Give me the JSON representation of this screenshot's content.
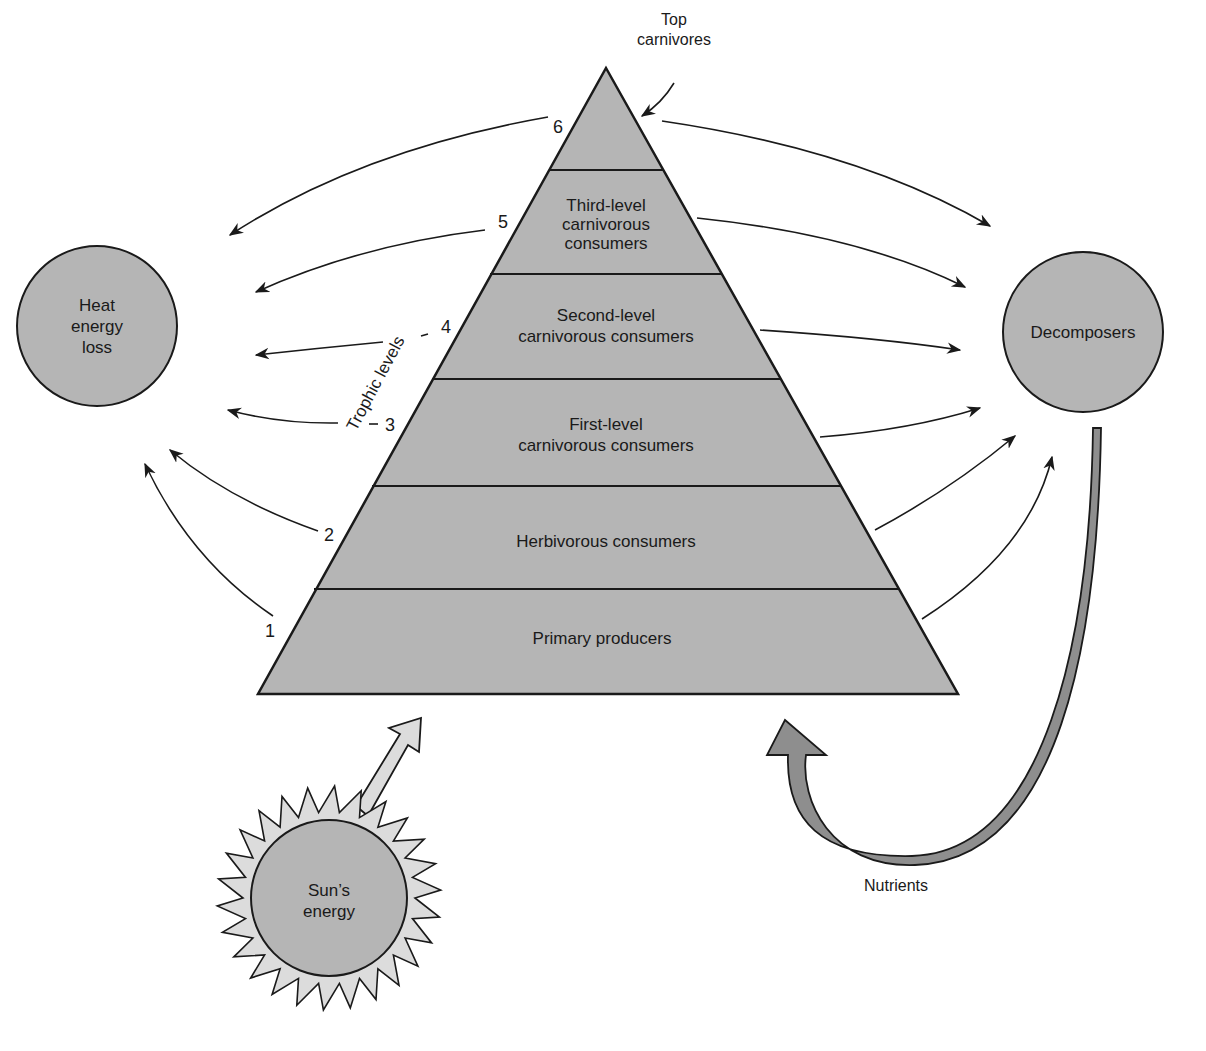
{
  "diagram": {
    "colors": {
      "fill_gray": "#b5b5b5",
      "fill_light": "#dcdcdc",
      "nutrient_arrow": "#8e8e8e",
      "stroke": "#1a1a1a",
      "background": "#ffffff"
    },
    "pyramid": {
      "top_label_line1": "Top",
      "top_label_line2": "carnivores",
      "axis_label": "Trophic levels",
      "bands": [
        {
          "level": "6",
          "lines": [
            "",
            "",
            ""
          ]
        },
        {
          "level": "5",
          "lines": [
            "Third-level",
            "carnivorous",
            "consumers"
          ]
        },
        {
          "level": "4",
          "lines": [
            "Second-level",
            "carnivorous consumers"
          ]
        },
        {
          "level": "3",
          "lines": [
            "First-level",
            "carnivorous consumers"
          ]
        },
        {
          "level": "2",
          "lines": [
            "Herbivorous consumers"
          ]
        },
        {
          "level": "1",
          "lines": [
            "Primary producers"
          ]
        }
      ]
    },
    "heat_loss": {
      "line1": "Heat",
      "line2": "energy",
      "line3": "loss"
    },
    "decomposers": {
      "label": "Decomposers"
    },
    "sun": {
      "line1": "Sun’s",
      "line2": "energy"
    },
    "nutrients": {
      "label": "Nutrients"
    }
  }
}
